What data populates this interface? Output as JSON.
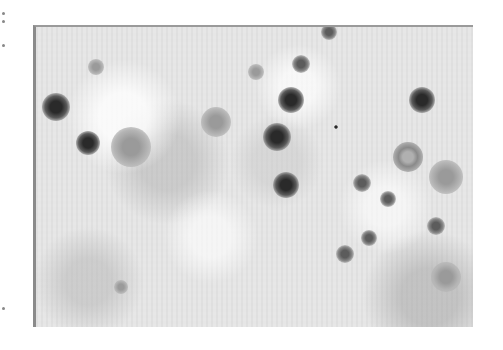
{
  "figure": {
    "colors": {
      "background": "#e6e6e6",
      "particle": "#2a2a2a",
      "border": "#8a8a8a"
    },
    "bounds": {
      "left": 33,
      "top": 25,
      "width": 437,
      "height": 300
    },
    "particles": [
      {
        "x": 20,
        "y": 80,
        "size": 28,
        "tone": "dark"
      },
      {
        "x": 52,
        "y": 116,
        "size": 24,
        "tone": "dark"
      },
      {
        "x": 255,
        "y": 73,
        "size": 26,
        "tone": "dark"
      },
      {
        "x": 241,
        "y": 110,
        "size": 28,
        "tone": "dark"
      },
      {
        "x": 250,
        "y": 158,
        "size": 26,
        "tone": "dark"
      },
      {
        "x": 386,
        "y": 73,
        "size": 26,
        "tone": "dark"
      },
      {
        "x": 265,
        "y": 37,
        "size": 18,
        "tone": "mid"
      },
      {
        "x": 220,
        "y": 45,
        "size": 16,
        "tone": "faint"
      },
      {
        "x": 326,
        "y": 156,
        "size": 18,
        "tone": "mid"
      },
      {
        "x": 352,
        "y": 172,
        "size": 16,
        "tone": "mid"
      },
      {
        "x": 400,
        "y": 199,
        "size": 18,
        "tone": "mid"
      },
      {
        "x": 333,
        "y": 211,
        "size": 16,
        "tone": "mid"
      },
      {
        "x": 309,
        "y": 227,
        "size": 18,
        "tone": "mid"
      },
      {
        "x": 293,
        "y": 5,
        "size": 16,
        "tone": "mid"
      },
      {
        "x": 372,
        "y": 130,
        "size": 30,
        "tone": "ring"
      },
      {
        "x": 410,
        "y": 150,
        "size": 34,
        "tone": "faint"
      },
      {
        "x": 95,
        "y": 120,
        "size": 40,
        "tone": "faint"
      },
      {
        "x": 180,
        "y": 95,
        "size": 30,
        "tone": "faint"
      },
      {
        "x": 410,
        "y": 250,
        "size": 30,
        "tone": "faint"
      },
      {
        "x": 85,
        "y": 260,
        "size": 14,
        "tone": "faint"
      },
      {
        "x": 300,
        "y": 100,
        "size": 4,
        "tone": "dark"
      },
      {
        "x": 60,
        "y": 40,
        "size": 16,
        "tone": "faint"
      }
    ]
  }
}
